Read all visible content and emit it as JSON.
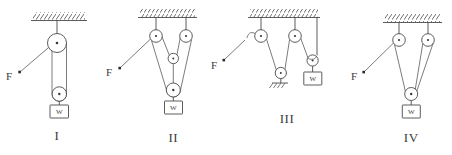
{
  "figure": {
    "background_color": "#ffffff",
    "line_color": "#4a4a4a",
    "text_color": "#3a3a3a"
  },
  "systems": [
    {
      "id": "I",
      "numeral": "I",
      "force_label": "F",
      "weight_label": "W",
      "fixed_pulleys": 1,
      "movable_pulleys": 1,
      "ground_anchor": false,
      "description": "One fixed pulley at ceiling with one movable pulley supporting the weight"
    },
    {
      "id": "II",
      "numeral": "II",
      "force_label": "F",
      "weight_label": "W",
      "fixed_pulleys": 2,
      "movable_pulleys": 2,
      "ground_anchor": false,
      "description": "Two fixed pulleys at ceiling, one intermediate movable pulley and one lower movable pulley carrying the weight"
    },
    {
      "id": "III",
      "numeral": "III",
      "force_label": "F",
      "weight_label": "W",
      "fixed_pulleys": 2,
      "movable_pulleys": 2,
      "ground_anchor": true,
      "description": "Two fixed ceiling pulleys, a movable pulley anchored to ground hatching, and a pulley holding the weight at right"
    },
    {
      "id": "IV",
      "numeral": "IV",
      "force_label": "F",
      "weight_label": "W",
      "fixed_pulleys": 2,
      "movable_pulleys": 1,
      "ground_anchor": false,
      "description": "Two fixed ceiling pulleys with a single movable pulley supporting the weight"
    }
  ],
  "labels": {
    "force": "F",
    "weight": "W",
    "numeral_one": "I",
    "numeral_two": "II",
    "numeral_three": "III",
    "numeral_four": "IV"
  }
}
